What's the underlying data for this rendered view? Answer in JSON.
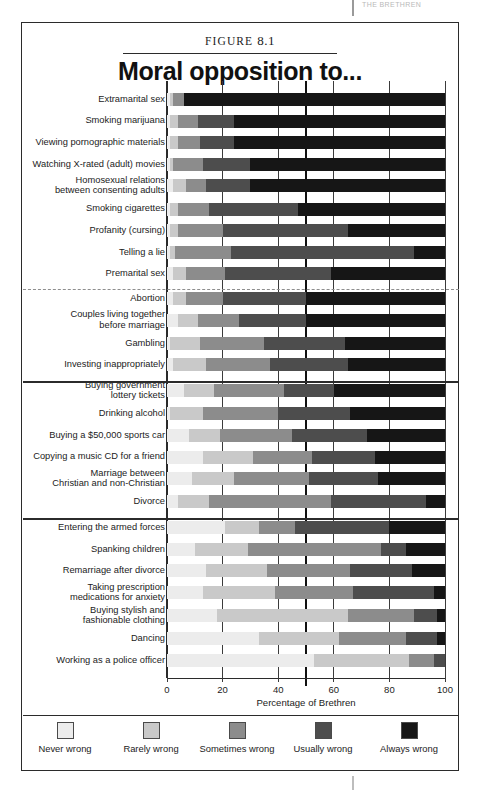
{
  "page": {
    "running_head": "THE BRETHREN",
    "figure_label_prefix": "FIGURE",
    "figure_number": "8.1"
  },
  "chart_data": {
    "type": "bar",
    "subtype": "stacked-horizontal-100",
    "title": "Moral opposition to...",
    "xlabel": "Percentage of Brethren",
    "ylabel": "",
    "xlim": [
      0,
      100
    ],
    "xticks": [
      0,
      20,
      40,
      60,
      80,
      100
    ],
    "xticklabels": [
      "0",
      "20",
      "40",
      "60",
      "80",
      "100"
    ],
    "grid": true,
    "legend_position": "bottom",
    "reference_line": 50,
    "legend": [
      "Never wrong",
      "Rarely wrong",
      "Sometimes wrong",
      "Usually wrong",
      "Always wrong"
    ],
    "colors": [
      "#ececec",
      "#c9c9c9",
      "#8c8c8c",
      "#4d4d4d",
      "#161616"
    ],
    "series": [
      {
        "name": "Never wrong",
        "color": "#ececec"
      },
      {
        "name": "Rarely wrong",
        "color": "#c9c9c9"
      },
      {
        "name": "Sometimes wrong",
        "color": "#8c8c8c"
      },
      {
        "name": "Usually wrong",
        "color": "#4d4d4d"
      },
      {
        "name": "Always wrong",
        "color": "#161616"
      }
    ],
    "categories": [
      "Extramarital sex",
      "Smoking marijuana",
      "Viewing pornographic materials",
      "Watching X-rated (adult) movies",
      "Homosexual relations\nbetween consenting adults",
      "Smoking cigarettes",
      "Profanity (cursing)",
      "Telling a lie",
      "Premarital sex",
      "Abortion",
      "Couples living together\nbefore marriage",
      "Gambling",
      "Investing inappropriately",
      "Buying government\nlottery tickets",
      "Drinking alcohol",
      "Buying a $50,000 sports car",
      "Copying a music CD for a friend",
      "Marriage between\nChristian and non-Christian",
      "Divorce",
      "Entering the armed forces",
      "Spanking children",
      "Remarriage after divorce",
      "Taking prescription\nmedications for anxiety",
      "Buying stylish and\nfashionable clothing",
      "Dancing",
      "Working as a police officer"
    ],
    "rows": [
      {
        "category": "Extramarital sex",
        "values": [
          1,
          1,
          4,
          0,
          94
        ]
      },
      {
        "category": "Smoking marijuana",
        "values": [
          1,
          3,
          7,
          13,
          76
        ]
      },
      {
        "category": "Viewing pornographic materials",
        "values": [
          1,
          3,
          8,
          12,
          76
        ]
      },
      {
        "category": "Watching X-rated (adult) movies",
        "values": [
          1,
          1,
          11,
          17,
          70
        ]
      },
      {
        "category": "Homosexual relations\nbetween consenting adults",
        "values": [
          2,
          5,
          7,
          16,
          70
        ]
      },
      {
        "category": "Smoking cigarettes",
        "values": [
          1,
          3,
          11,
          32,
          53
        ]
      },
      {
        "category": "Profanity (cursing)",
        "values": [
          1,
          3,
          16,
          45,
          35
        ]
      },
      {
        "category": "Telling a lie",
        "values": [
          1,
          2,
          20,
          66,
          11
        ]
      },
      {
        "category": "Premarital sex",
        "values": [
          2,
          5,
          14,
          38,
          41
        ]
      },
      {
        "category": "Abortion",
        "values": [
          2,
          5,
          13,
          30,
          50
        ]
      },
      {
        "category": "Couples living together\nbefore marriage",
        "values": [
          4,
          7,
          15,
          24,
          50
        ]
      },
      {
        "category": "Gambling",
        "values": [
          1,
          11,
          23,
          29,
          36
        ]
      },
      {
        "category": "Investing inappropriately",
        "values": [
          2,
          12,
          23,
          28,
          35
        ]
      },
      {
        "category": "Buying government\nlottery tickets",
        "values": [
          6,
          11,
          25,
          18,
          40
        ]
      },
      {
        "category": "Drinking alcohol",
        "values": [
          1,
          12,
          27,
          26,
          34
        ]
      },
      {
        "category": "Buying a $50,000 sports car",
        "values": [
          8,
          11,
          26,
          27,
          28
        ]
      },
      {
        "category": "Copying a music CD for a friend",
        "values": [
          13,
          18,
          21,
          23,
          25
        ]
      },
      {
        "category": "Marriage between\nChristian and non-Christian",
        "values": [
          9,
          15,
          27,
          25,
          24
        ]
      },
      {
        "category": "Divorce",
        "values": [
          4,
          11,
          44,
          34,
          7
        ]
      },
      {
        "category": "Entering the armed forces",
        "values": [
          21,
          12,
          13,
          34,
          20
        ]
      },
      {
        "category": "Spanking children",
        "values": [
          10,
          19,
          48,
          9,
          14
        ]
      },
      {
        "category": "Remarriage after divorce",
        "values": [
          14,
          22,
          30,
          22,
          12
        ]
      },
      {
        "category": "Taking prescription\nmedications for anxiety",
        "values": [
          13,
          26,
          28,
          29,
          4
        ]
      },
      {
        "category": "Buying stylish and\nfashionable clothing",
        "values": [
          18,
          47,
          24,
          8,
          3
        ]
      },
      {
        "category": "Dancing",
        "values": [
          33,
          29,
          24,
          11,
          3
        ]
      },
      {
        "category": "Working as a police officer",
        "values": [
          53,
          34,
          9,
          4,
          0
        ]
      }
    ],
    "group_dividers_after": [
      "Premarital sex",
      "Investing inappropriately",
      "Divorce"
    ],
    "dashed_divider_after": [
      "Premarital sex"
    ]
  }
}
